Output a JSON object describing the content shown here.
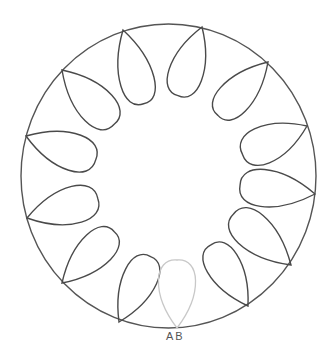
{
  "diagram": {
    "type": "circle-with-loops",
    "outer_circle": {
      "cx": 168.5,
      "cy": 176,
      "rx": 147.5,
      "ry": 152,
      "stroke": "#555555"
    },
    "loop_count_drawn": 12,
    "loop_count_faint": 1,
    "loop_stroke": "#4a4a4a",
    "faint_loop_stroke": "#c8c8c8",
    "labels": {
      "bottom": "AB"
    }
  }
}
